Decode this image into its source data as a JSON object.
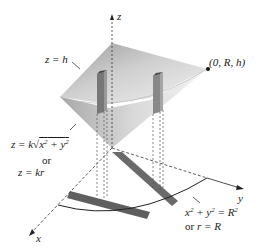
{
  "diagram": {
    "axes": {
      "z_label": "z",
      "x_label": "x",
      "y_label": "y"
    },
    "labels": {
      "top_plane": "z = h",
      "point": "(0, R, h)",
      "cone_eq_line1": "z = k√(x² + y²)",
      "cone_eq_or": "or",
      "cone_eq_line2": "z = kr",
      "base_eq_line1": "x² + y² = R²",
      "base_eq_line2": "or r = R"
    },
    "colors": {
      "cone_light": "#e8e8e8",
      "cone_mid": "#bdbdbd",
      "cone_dark": "#8e8e8e",
      "column": "#6f6f6f",
      "shadow": "#5a5a5a",
      "line": "#222222"
    }
  }
}
